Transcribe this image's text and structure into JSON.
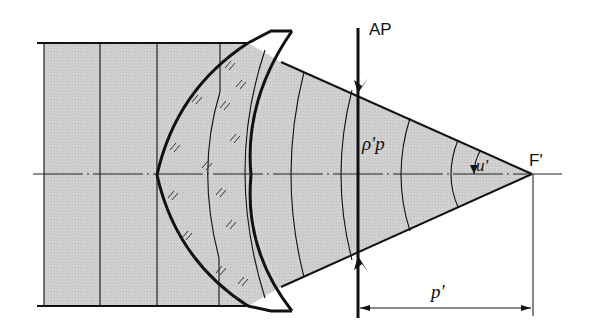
{
  "diagram": {
    "labels": {
      "aperture_plane": "AP",
      "focal_point": "F'",
      "pupil_radius": "ρ'p",
      "angle": "u'",
      "distance": "p'"
    },
    "colors": {
      "beam_fill": "#cdcdcd",
      "stroke": "#111111",
      "background": "#ffffff"
    },
    "elements": [
      "incoming parallel beam with plane wavefronts",
      "meniscus lens with hatched glass",
      "converging cone with spherical wavefronts",
      "aperture plane AP with marker arrows",
      "optical axis (dash-dot)",
      "dimension arrow p' from AP to F'"
    ]
  }
}
